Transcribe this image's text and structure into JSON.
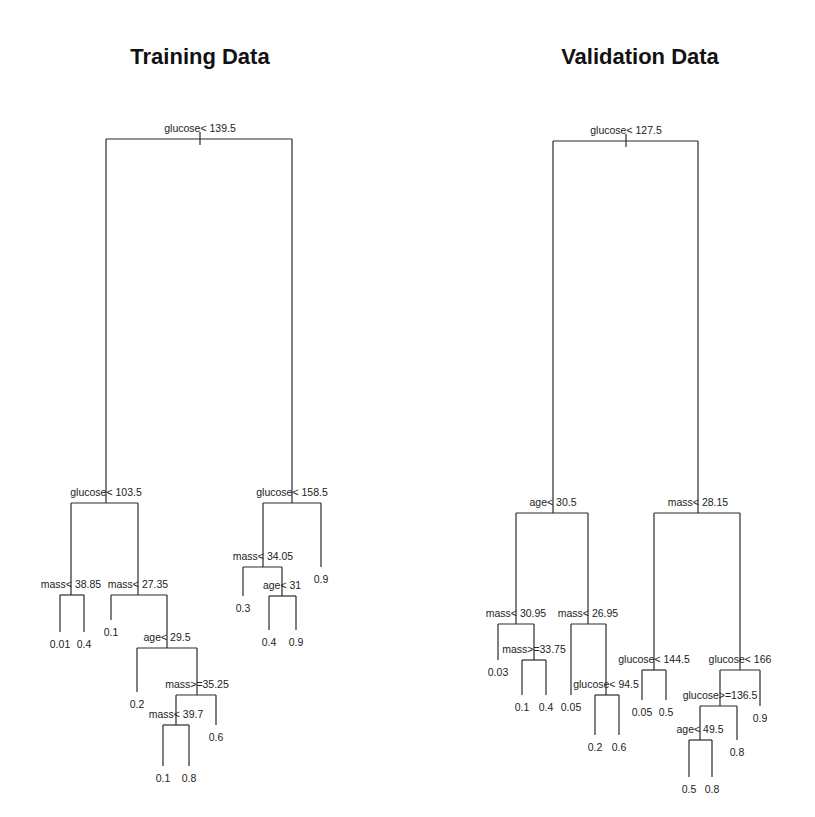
{
  "figure": {
    "panels": [
      {
        "id": "training",
        "title": "Training Data",
        "tree": {
          "split": "glucose< 139.5",
          "left": {
            "split": "glucose< 103.5",
            "left": {
              "split": "mass< 38.85",
              "left": {
                "leaf": "0.01"
              },
              "right": {
                "leaf": "0.4"
              }
            },
            "right": {
              "split": "mass< 27.35",
              "left": {
                "leaf": "0.1"
              },
              "right": {
                "split": "age< 29.5",
                "left": {
                  "leaf": "0.2"
                },
                "right": {
                  "split": "mass>=35.25",
                  "left": {
                    "split": "mass< 39.7",
                    "left": {
                      "leaf": "0.1"
                    },
                    "right": {
                      "leaf": "0.8"
                    }
                  },
                  "right": {
                    "leaf": "0.6"
                  }
                }
              }
            }
          },
          "right": {
            "split": "glucose< 158.5",
            "left": {
              "split": "mass< 34.05",
              "left": {
                "leaf": "0.3"
              },
              "right": {
                "split": "age< 31",
                "left": {
                  "leaf": "0.4"
                },
                "right": {
                  "leaf": "0.9"
                }
              }
            },
            "right": {
              "leaf": "0.9"
            }
          }
        }
      },
      {
        "id": "validation",
        "title": "Validation Data",
        "tree": {
          "split": "glucose< 127.5",
          "left": {
            "split": "age< 30.5",
            "left": {
              "split": "mass< 30.95",
              "left": {
                "leaf": "0.03"
              },
              "right": {
                "split": "mass>=33.75",
                "left": {
                  "leaf": "0.1"
                },
                "right": {
                  "leaf": "0.4"
                }
              }
            },
            "right": {
              "split": "mass< 26.95",
              "left": {
                "leaf": "0.05"
              },
              "right": {
                "split": "glucose< 94.5",
                "left": {
                  "leaf": "0.2"
                },
                "right": {
                  "leaf": "0.6"
                }
              }
            }
          },
          "right": {
            "split": "mass< 28.15",
            "left": {
              "split": "glucose< 144.5",
              "left": {
                "leaf": "0.05"
              },
              "right": {
                "leaf": "0.5"
              }
            },
            "right": {
              "split": "glucose< 166",
              "left": {
                "split": "glucose>=136.5",
                "left": {
                  "split": "age< 49.5",
                  "left": {
                    "leaf": "0.5"
                  },
                  "right": {
                    "leaf": "0.8"
                  }
                },
                "right": {
                  "leaf": "0.8"
                }
              },
              "right": {
                "leaf": "0.9"
              }
            }
          }
        }
      }
    ]
  }
}
